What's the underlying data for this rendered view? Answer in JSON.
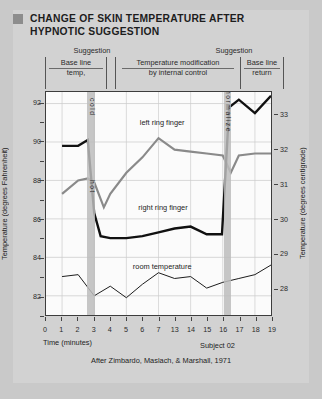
{
  "title": {
    "text": "CHANGE OF SKIN TEMPERATURE AFTER HYPNOTIC SUGGESTION",
    "bullet_color": "#8d8d8d"
  },
  "header": {
    "suggestion_left": "Suggestion",
    "suggestion_right": "Suggestion",
    "phases": [
      {
        "line1": "Base line",
        "line2": "temp,"
      },
      {
        "line1": "Temperature  modification",
        "line2": "by internal control"
      },
      {
        "line1": "Base line",
        "line2": "return"
      }
    ]
  },
  "annotations": {
    "band1_top": "cold",
    "band1_bottom": "hot",
    "band2": "normalize"
  },
  "footer": {
    "subject": "Subject 02",
    "credit": "After Zimbardo, Maslach, & Marshall, 1971"
  },
  "chart_data": {
    "type": "line",
    "title": "CHANGE OF SKIN TEMPERATURE AFTER HYPNOTIC SUGGESTION",
    "xlabel": "Time (minutes)",
    "ylabel": "Temperature (degrees Fahrenheit)",
    "ylabel_right": "Temperature (degrees centigrade)",
    "x_tick_labels": [
      "0",
      "1",
      "2",
      "3",
      "4",
      "5",
      "6",
      "7",
      "13",
      "14",
      "15",
      "16",
      "17",
      "18",
      "19"
    ],
    "ylim": [
      81,
      92.6
    ],
    "y_tick_labels": [
      "92",
      "90",
      "88",
      "86",
      "84",
      "82"
    ],
    "y_ticks": [
      92,
      90,
      88,
      86,
      84,
      82
    ],
    "y_tick_labels_right": [
      "33",
      "32",
      "31",
      "30",
      "29",
      "28"
    ],
    "y_ticks_right": [
      33,
      32,
      31,
      30,
      29,
      28
    ],
    "grid": true,
    "legend": "inline-labels",
    "bands": [
      {
        "label": "cold / hot",
        "x_start": 2.55,
        "x_end": 3.0
      },
      {
        "label": "normalize",
        "x_start": 15.95,
        "x_end": 16.4
      }
    ],
    "series": [
      {
        "name": "left ring finger",
        "color": "#8a8a8a",
        "width": 2.2,
        "label_x": 8.0,
        "label_y": 91.0,
        "x": [
          1,
          2,
          2.6,
          3,
          3.6,
          4,
          5,
          6,
          7,
          13,
          14,
          15,
          16,
          16.5,
          17,
          18,
          19
        ],
        "y": [
          87.3,
          88.0,
          88.1,
          87.9,
          86.6,
          87.3,
          88.4,
          89.2,
          90.2,
          89.6,
          89.5,
          89.4,
          89.3,
          88.4,
          89.3,
          89.4,
          89.4
        ]
      },
      {
        "name": "right ring finger",
        "color": "#111111",
        "width": 2.4,
        "label_x": 8.3,
        "label_y": 86.6,
        "x": [
          1,
          2,
          2.6,
          3,
          3.4,
          4,
          5,
          6,
          7,
          13,
          14,
          15,
          15.95,
          16.4,
          17,
          18,
          19
        ],
        "y": [
          89.8,
          89.8,
          90.1,
          86.3,
          85.1,
          85.0,
          85.0,
          85.1,
          85.3,
          85.5,
          85.6,
          85.2,
          85.2,
          91.8,
          92.2,
          91.5,
          92.4
        ]
      },
      {
        "name": "room temperature",
        "color": "#1a1a1a",
        "width": 1.0,
        "label_x": 8.0,
        "label_y": 83.6,
        "x": [
          1,
          2,
          3,
          4,
          5,
          6,
          7,
          13,
          14,
          15,
          16,
          17,
          18,
          19
        ],
        "y": [
          83.0,
          83.1,
          82.0,
          82.5,
          81.9,
          82.6,
          83.2,
          82.9,
          83.0,
          82.4,
          82.7,
          82.9,
          83.1,
          83.6
        ]
      }
    ]
  }
}
